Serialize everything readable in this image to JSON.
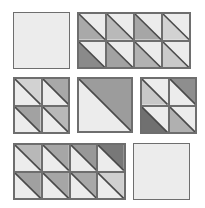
{
  "light_color": "#ececec",
  "line_color": "#4a4a4a",
  "blocks": [
    {
      "name": "plain-square-top-left",
      "x": 13,
      "y": 12,
      "w": 57,
      "h": 57,
      "cols": 1,
      "rows": 1,
      "cells": []
    },
    {
      "name": "hst-block-top-right",
      "x": 77,
      "y": 12,
      "w": 114,
      "h": 57,
      "cols": 4,
      "rows": 2,
      "cells": [
        {
          "shade": "lower-left",
          "color": "#a9a9a9"
        },
        {
          "shade": "lower-left",
          "color": "#b9b9b9"
        },
        {
          "shade": "lower-left",
          "color": "#a6a6a6"
        },
        {
          "shade": "lower-left",
          "color": "#d2d2d2"
        },
        {
          "shade": "lower-left",
          "color": "#8a8a8a"
        },
        {
          "shade": "lower-left",
          "color": "#a2a2a2"
        },
        {
          "shade": "lower-left",
          "color": "#b2b2b2"
        },
        {
          "shade": "lower-left",
          "color": "#cacaca"
        }
      ]
    },
    {
      "name": "hst-block-middle-left",
      "x": 13,
      "y": 77,
      "w": 57,
      "h": 57,
      "cols": 2,
      "rows": 2,
      "cells": [
        {
          "shade": "upper-right",
          "color": "#d2d2d2"
        },
        {
          "shade": "upper-right",
          "color": "#a8a8a8"
        },
        {
          "shade": "upper-right",
          "color": "#a2a2a2"
        },
        {
          "shade": "upper-right",
          "color": "#b8b8b8"
        }
      ]
    },
    {
      "name": "hst-block-middle-center",
      "x": 77,
      "y": 77,
      "w": 56,
      "h": 56,
      "cols": 1,
      "rows": 1,
      "cells": [
        {
          "shade": "upper-right",
          "color": "#9c9c9c"
        }
      ]
    },
    {
      "name": "hst-block-middle-right",
      "x": 140,
      "y": 77,
      "w": 57,
      "h": 57,
      "cols": 2,
      "rows": 2,
      "cells": [
        {
          "shade": "lower-left",
          "color": "#c8c8c8"
        },
        {
          "shade": "upper-right",
          "color": "#8e8e8e"
        },
        {
          "shade": "lower-left",
          "color": "#707070"
        },
        {
          "shade": "lower-left",
          "color": "#b0b0b0"
        }
      ]
    },
    {
      "name": "hst-block-bottom-left",
      "x": 13,
      "y": 143,
      "w": 113,
      "h": 57,
      "cols": 4,
      "rows": 2,
      "cells": [
        {
          "shade": "upper-right",
          "color": "#b8b8b8"
        },
        {
          "shade": "upper-right",
          "color": "#a6a6a6"
        },
        {
          "shade": "upper-right",
          "color": "#989898"
        },
        {
          "shade": "upper-right",
          "color": "#787878"
        },
        {
          "shade": "upper-right",
          "color": "#a0a0a0"
        },
        {
          "shade": "upper-right",
          "color": "#a6a6a6"
        },
        {
          "shade": "upper-right",
          "color": "#a8a8a8"
        },
        {
          "shade": "upper-right",
          "color": "#d0d0d0"
        }
      ]
    },
    {
      "name": "plain-square-bottom-right",
      "x": 133,
      "y": 143,
      "w": 57,
      "h": 57,
      "cols": 1,
      "rows": 1,
      "cells": []
    }
  ]
}
